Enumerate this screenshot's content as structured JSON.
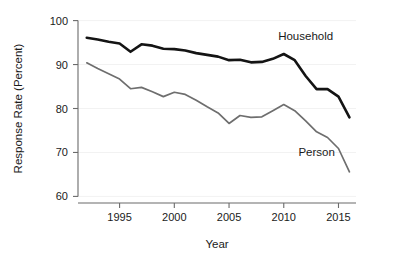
{
  "chart_data": {
    "type": "line",
    "title": "",
    "subtitle": "",
    "xlabel": "Year",
    "ylabel": "Response Rate (Percent)",
    "xlim": [
      1991.2,
      2016.6
    ],
    "ylim": [
      58.5,
      101.5
    ],
    "xticks": [
      1995,
      2000,
      2005,
      2010,
      2015
    ],
    "xtick_labels": [
      "1995",
      "2000",
      "2005",
      "2010",
      "2015"
    ],
    "yticks": [
      60,
      70,
      80,
      90,
      100
    ],
    "ytick_labels": [
      "60",
      "70",
      "80",
      "90",
      "100"
    ],
    "grid": false,
    "legend_position": "inline-annotation",
    "x": [
      1992,
      1993,
      1994,
      1995,
      1996,
      1997,
      1998,
      1999,
      2000,
      2001,
      2002,
      2003,
      2004,
      2005,
      2006,
      2007,
      2008,
      2009,
      2010,
      2011,
      2012,
      2013,
      2014,
      2015,
      2016
    ],
    "series": [
      {
        "name": "Household",
        "color": "#141414",
        "line_width": 2.6,
        "label_text": "Household",
        "values": [
          96.1,
          95.7,
          95.2,
          94.8,
          92.9,
          94.6,
          94.3,
          93.6,
          93.5,
          93.2,
          92.6,
          92.2,
          91.8,
          91.0,
          91.1,
          90.5,
          90.6,
          91.3,
          92.4,
          91.0,
          87.4,
          84.4,
          84.4,
          82.7,
          78.0
        ]
      },
      {
        "name": "Person",
        "color": "#6e6e6e",
        "line_width": 1.7,
        "label_text": "Person",
        "values": [
          90.4,
          89.1,
          87.9,
          86.7,
          84.5,
          84.8,
          83.8,
          82.7,
          83.7,
          83.2,
          81.9,
          80.4,
          79.0,
          76.6,
          78.4,
          78.0,
          78.1,
          79.5,
          80.9,
          79.5,
          77.2,
          74.7,
          73.4,
          70.9,
          65.6
        ]
      }
    ],
    "annotations": [
      {
        "text": "Household",
        "x": 2012.0,
        "y": 95.6,
        "color": "#141414"
      },
      {
        "text": "Person",
        "x": 2013.0,
        "y": 69.2,
        "color": "#5e5e5e"
      }
    ]
  }
}
